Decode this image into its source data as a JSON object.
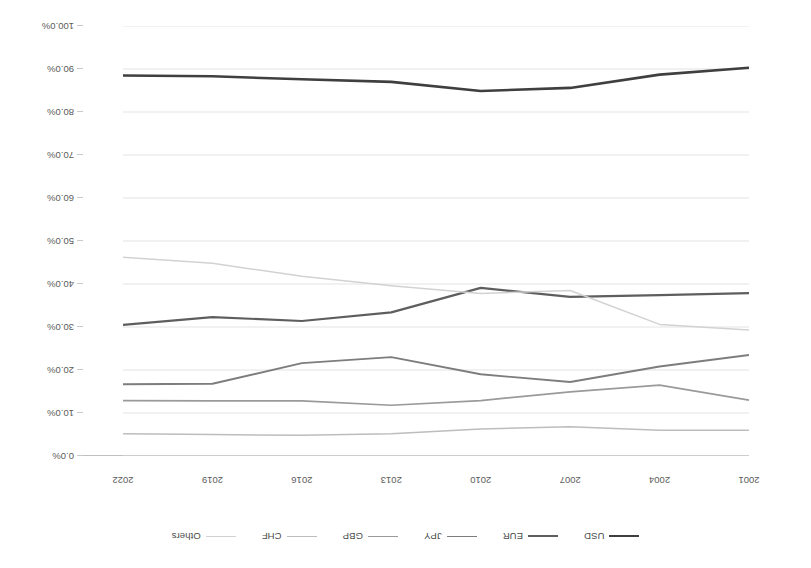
{
  "chart_data": {
    "type": "line",
    "title": "",
    "xlabel": "",
    "ylabel": "",
    "orientation": "rotated-180",
    "grid": true,
    "legend_position": "top",
    "ylim": [
      0,
      100
    ],
    "ytick_labels": [
      "0.0%",
      "10.0%",
      "20.0%",
      "30.0%",
      "40.0%",
      "50.0%",
      "60.0%",
      "70.0%",
      "80.0%",
      "90.0%",
      "100.0%"
    ],
    "ytick_values": [
      0,
      10,
      20,
      30,
      40,
      50,
      60,
      70,
      80,
      90,
      100
    ],
    "categories": [
      "2001",
      "2004",
      "2007",
      "2010",
      "2013",
      "2016",
      "2019",
      "2022"
    ],
    "xtick_labels_as_drawn": [
      "2022",
      "2019",
      "2016",
      "2013",
      "2010",
      "2007",
      "2004",
      "2001"
    ],
    "series": [
      {
        "name": "USD",
        "color": "#3f3f3f",
        "width": 2.6,
        "values": [
          90.3,
          88.7,
          85.6,
          84.9,
          87.0,
          87.6,
          88.3,
          88.5
        ]
      },
      {
        "name": "EUR",
        "color": "#5e5e5e",
        "width": 2.2,
        "values": [
          37.9,
          37.4,
          37.0,
          39.1,
          33.4,
          31.4,
          32.3,
          30.5
        ]
      },
      {
        "name": "JPY",
        "color": "#7d7d7d",
        "width": 1.9,
        "values": [
          23.5,
          20.8,
          17.2,
          19.0,
          23.0,
          21.6,
          16.8,
          16.7
        ]
      },
      {
        "name": "GBP",
        "color": "#9a9a9a",
        "width": 1.7,
        "values": [
          13.0,
          16.5,
          14.9,
          12.9,
          11.8,
          12.8,
          12.8,
          12.9
        ]
      },
      {
        "name": "CHF",
        "color": "#bdbdbd",
        "width": 1.5,
        "values": [
          6.0,
          6.0,
          6.8,
          6.3,
          5.2,
          4.8,
          5.0,
          5.2
        ]
      },
      {
        "name": "Others",
        "color": "#d2d2d2",
        "width": 1.5,
        "values": [
          29.3,
          30.6,
          38.5,
          37.8,
          39.6,
          41.8,
          44.8,
          46.2
        ]
      }
    ]
  },
  "legend": {
    "items": [
      {
        "label": "USD",
        "color": "#3f3f3f"
      },
      {
        "label": "EUR",
        "color": "#5e5e5e"
      },
      {
        "label": "JPY",
        "color": "#7d7d7d"
      },
      {
        "label": "GBP",
        "color": "#9a9a9a"
      },
      {
        "label": "CHF",
        "color": "#bdbdbd"
      },
      {
        "label": "Others",
        "color": "#d2d2d2"
      }
    ]
  },
  "axes": {
    "x_tick_labels": [
      "2022",
      "2019",
      "2016",
      "2013",
      "2010",
      "2007",
      "2004",
      "2001"
    ],
    "y_tick_labels": [
      "0.0%",
      "10.0%",
      "20.0%",
      "30.0%",
      "40.0%",
      "50.0%",
      "60.0%",
      "70.0%",
      "80.0%",
      "90.0%",
      "100.0%"
    ]
  },
  "colors": {
    "gridline": "#dcdcdc",
    "axis": "#c0c0c0",
    "text": "#5a5a5a",
    "background": "#ffffff"
  }
}
